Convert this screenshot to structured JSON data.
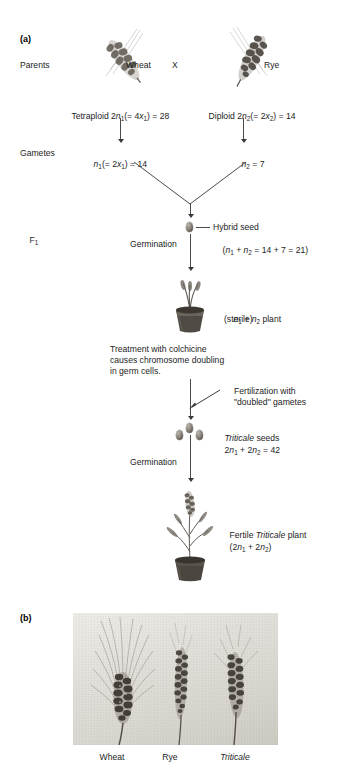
{
  "figure": {
    "panel_a_label": "(a)",
    "panel_b_label": "(b)"
  },
  "panel_a": {
    "row_labels": {
      "parents": "Parents",
      "gametes": "Gametes",
      "f1": "F",
      "f1_sub": "1"
    },
    "parents": {
      "wheat_label": "Wheat",
      "cross_symbol": "X",
      "rye_label": "Rye",
      "wheat_ploidy": {
        "prefix": "Tetraploid 2",
        "var": "n",
        "sub": "1",
        "mid": "(= 4",
        "var2": "x",
        "sub2": "1",
        "suffix": ") = 28"
      },
      "rye_ploidy": {
        "prefix": "Diploid 2",
        "var": "n",
        "sub": "2",
        "mid": "(= 2",
        "var2": "x",
        "sub2": "2",
        "suffix": ") = 14"
      }
    },
    "gametes": {
      "wheat_gamete": {
        "var": "n",
        "sub": "1",
        "mid": "(= 2",
        "var2": "x",
        "sub2": "1",
        "suffix": ") = 14"
      },
      "rye_gamete": {
        "var": "n",
        "sub": "2",
        "suffix": " = 7"
      }
    },
    "hybrid_seed": {
      "label": "Hybrid seed",
      "formula_open": "(",
      "var1": "n",
      "sub1": "1",
      "plus": " + ",
      "var2": "n",
      "sub2": "2",
      "formula_close": " = 14 + 7 = 21)"
    },
    "germination_1": "Germination",
    "sterile_plant": {
      "var1": "n",
      "sub1": "1",
      "plus": " + ",
      "var2": "n",
      "sub2": "2",
      "suffix": " plant",
      "line2": "(sterile)"
    },
    "colchicine_note": [
      "Treatment with colchicine",
      "causes chromosome doubling",
      "in germ cells."
    ],
    "fertilization_note": [
      "Fertilization with",
      "\"doubled\" gametes"
    ],
    "triticale_seeds": {
      "name": "Triticale",
      "label_suffix": " seeds",
      "formula_pre": "2",
      "var1": "n",
      "sub1": "1",
      "plus": " + 2",
      "var2": "n",
      "sub2": "2",
      "formula_post": " = 42"
    },
    "germination_2": "Germination",
    "fertile_plant": {
      "prefix": "Fertile ",
      "name": "Triticale",
      "suffix": " plant",
      "formula_open": "(2",
      "var1": "n",
      "sub1": "1",
      "plus": " + 2",
      "var2": "n",
      "sub2": "2",
      "formula_close": ")"
    }
  },
  "panel_b": {
    "captions": [
      {
        "text": "Wheat",
        "italic": false
      },
      {
        "text": "Rye",
        "italic": false
      },
      {
        "text": "Triticale",
        "italic": true
      }
    ]
  },
  "colors": {
    "text": "#1d1d1d",
    "line": "#4a4a4a",
    "seed": "#8e8880",
    "photo_bg": "#e4e2dc"
  }
}
